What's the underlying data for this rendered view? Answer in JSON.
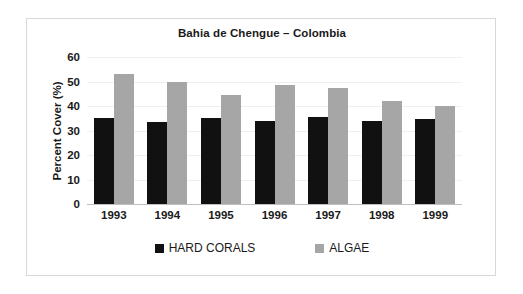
{
  "chart_data": {
    "type": "bar",
    "title": "Bahia de Chengue – Colombia",
    "xlabel": "",
    "ylabel": "Percent Cover (%)",
    "categories": [
      "1993",
      "1994",
      "1995",
      "1996",
      "1997",
      "1998",
      "1999"
    ],
    "series": [
      {
        "name": "HARD CORALS",
        "color": "#111111",
        "values": [
          35,
          33.5,
          35,
          34,
          35.5,
          34,
          34.5
        ]
      },
      {
        "name": "ALGAE",
        "color": "#a6a6a6",
        "values": [
          53,
          50,
          44.5,
          48.5,
          47.5,
          42,
          40
        ]
      }
    ],
    "ylim": [
      0,
      60
    ],
    "yticks": [
      0,
      10,
      20,
      30,
      40,
      50,
      60
    ],
    "ytick_labels": [
      "0",
      "10",
      "20",
      "30",
      "40",
      "50",
      "60"
    ],
    "grid": true,
    "legend_position": "bottom"
  },
  "frame": {
    "border_color": "#d8d8d8"
  }
}
